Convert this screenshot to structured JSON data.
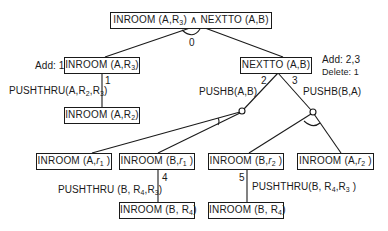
{
  "diagram": {
    "type": "and-or goal tree",
    "root": {
      "label_main_a": "INROOM (A,R",
      "label_sub_a": "3",
      "label_main_b": ") ∧ NEXTTO (A,B)",
      "and_arc_label": "0"
    },
    "left_goal": {
      "label_main": "INROOM (A,R",
      "label_sub": "3",
      "label_end": ")",
      "annotation": "Add: 1",
      "edge_number": "1",
      "operator_main": "PUSHTHRU(A,R",
      "operator_sub1": "2",
      "operator_mid": ",R",
      "operator_sub2": "3",
      "operator_end": ")"
    },
    "left_subgoal": {
      "label_main": "INROOM (A,R",
      "label_sub": "2",
      "label_end": ")"
    },
    "right_goal": {
      "label": "NEXTTO (A,B)",
      "annotation_add": "Add: 2,3",
      "annotation_delete": "Delete: 1",
      "edge_left_number": "2",
      "edge_right_number": "3",
      "operator_left": "PUSHB(A,B)",
      "operator_right": "PUSHB(B,A)"
    },
    "bottom_row": [
      {
        "label_main": "INROOM (A,",
        "label_var": "r",
        "label_sub": "1",
        "label_end": " )"
      },
      {
        "label_main": "INROOM (B,",
        "label_var": "r",
        "label_sub": "1",
        "label_end": " )"
      },
      {
        "label_main": "INROOM (B,",
        "label_var": "r",
        "label_sub": "2",
        "label_end": " )"
      },
      {
        "label_main": "INROOM (A,",
        "label_var": "r",
        "label_sub": "2",
        "label_end": " )"
      }
    ],
    "branch_4": {
      "edge_number": "4",
      "operator_main": "PUSHTHRU (B, R",
      "operator_sub1": "4",
      "operator_mid": ",R",
      "operator_sub2": "3",
      "operator_end": ")",
      "result_main": "INROOM (B, R",
      "result_sub": "4",
      "result_end": ")"
    },
    "branch_5": {
      "edge_number": "5",
      "operator_main": "PUSHTHRU(B, R",
      "operator_sub1": "4",
      "operator_mid": ",R",
      "operator_sub2": "3",
      "operator_end": " )",
      "result_main": "INROOM (B, R",
      "result_sub": "4",
      "result_end": ")"
    }
  }
}
